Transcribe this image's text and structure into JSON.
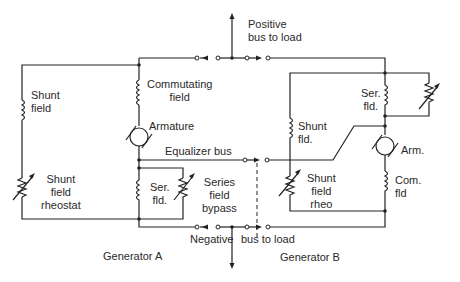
{
  "labels": {
    "positive_bus": "Positive\nbus to load",
    "negative": "Negative",
    "bus_to_load": "bus to load",
    "equalizer_bus": "Equalizer bus",
    "generator_a": "Generator A",
    "generator_b": "Generator B"
  },
  "generator_a": {
    "shunt_field": "Shunt\nfield",
    "commutating_field": "Commutating\nfield",
    "armature": "Armature",
    "shunt_field_rheostat": "Shunt\nfield\nrheostat",
    "series_field": "Ser.\nfld.",
    "series_field_bypass": "Series\nfield\nbypass"
  },
  "generator_b": {
    "series_field": "Ser.\nfld.",
    "shunt_field": "Shunt\nfld.",
    "armature": "Arm.",
    "shunt_field_rheo": "Shunt\nfield\nrheo",
    "commutating_field": "Com.\nfld"
  }
}
